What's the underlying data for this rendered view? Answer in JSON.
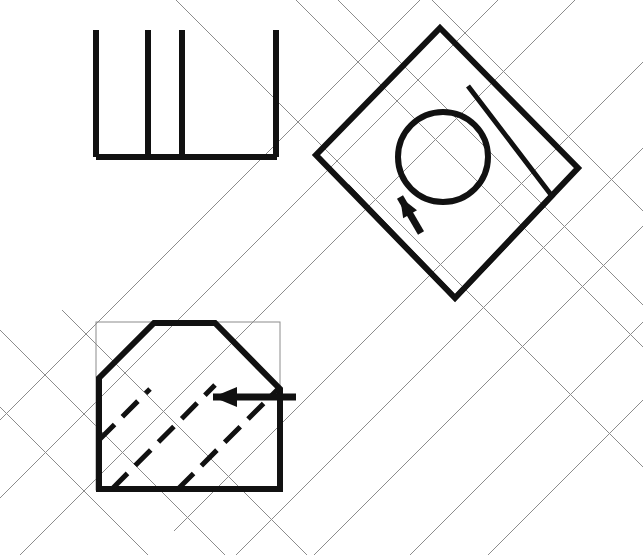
{
  "drawing": {
    "title": "Orthographic and auxiliary view projection",
    "canvas": {
      "width": 643,
      "height": 555,
      "background": "#ffffff"
    },
    "styles": {
      "object_color": "#111111",
      "construction_color": "#8c8c8c",
      "hidden_color": "#111111",
      "object_width": 6,
      "construction_width": 1,
      "hidden_dash": "22 11"
    },
    "views": [
      {
        "id": "top-view",
        "name": "Top view (plan)",
        "description": "Open rectangle outline with three internal vertical division lines",
        "bounds": {
          "x": 93,
          "y": 30,
          "width": 186,
          "height": 130
        },
        "elements": {
          "bottom_edge": {
            "x1": 96,
            "y1": 157,
            "x2": 277,
            "y2": 157
          },
          "vertical_lines": [
            {
              "x": 96,
              "y1": 30,
              "y2": 157
            },
            {
              "x": 148,
              "y1": 30,
              "y2": 157
            },
            {
              "x": 182,
              "y1": 30,
              "y2": 157
            },
            {
              "x": 276,
              "y1": 30,
              "y2": 157
            }
          ]
        }
      },
      {
        "id": "auxiliary-view",
        "name": "Auxiliary view (rotated 45 degrees)",
        "description": "Diamond outline with inner offset square, circular hole and viewing arrow",
        "outer_diamond": [
          {
            "x": 440,
            "y": 28
          },
          {
            "x": 578,
            "y": 168
          },
          {
            "x": 455,
            "y": 298
          },
          {
            "x": 316,
            "y": 155
          }
        ],
        "inner_square": [
          {
            "x": 468,
            "y": 86
          },
          {
            "x": 552,
            "y": 196
          },
          {
            "x": 455,
            "y": 298
          },
          {
            "x": 347,
            "y": 186
          }
        ],
        "circle": {
          "cx": 443,
          "cy": 157,
          "r": 45
        },
        "arrow": {
          "x1": 421,
          "y1": 233,
          "x2": 400,
          "y2": 197,
          "direction": "up-left"
        }
      },
      {
        "id": "front-view",
        "name": "Front view with chamfer",
        "description": "Hexagonal outline with chamfered upper-left and lower-right corners, hidden edges shown dashed, enclosed by grey construction rectangle",
        "construction_box": {
          "x": 96,
          "y": 322,
          "width": 184,
          "height": 168
        },
        "outline": [
          {
            "x": 99,
            "y": 378
          },
          {
            "x": 154,
            "y": 323
          },
          {
            "x": 215,
            "y": 323
          },
          {
            "x": 280,
            "y": 389
          },
          {
            "x": 280,
            "y": 489
          },
          {
            "x": 99,
            "y": 489
          }
        ],
        "hidden_lines": [
          {
            "x1": 112,
            "y1": 489,
            "x2": 215,
            "y2": 385
          },
          {
            "x1": 178,
            "y1": 489,
            "x2": 280,
            "y2": 387
          },
          {
            "x1": 99,
            "y1": 440,
            "x2": 150,
            "y2": 389
          }
        ],
        "arrow": {
          "x1": 296,
          "y1": 397,
          "x2": 213,
          "y2": 397,
          "direction": "left"
        }
      }
    ],
    "construction_lines": {
      "description": "Light grey 45-degree projection lines linking the three views",
      "down_right_45": [
        {
          "x1": 176,
          "y1": 0,
          "x2": 643,
          "y2": 467
        },
        {
          "x1": 296,
          "y1": 0,
          "x2": 643,
          "y2": 347
        },
        {
          "x1": 338,
          "y1": 0,
          "x2": 643,
          "y2": 305
        },
        {
          "x1": 432,
          "y1": 0,
          "x2": 643,
          "y2": 211
        },
        {
          "x1": 0,
          "y1": 330,
          "x2": 225,
          "y2": 555
        },
        {
          "x1": 0,
          "y1": 407,
          "x2": 148,
          "y2": 555
        },
        {
          "x1": 62,
          "y1": 310,
          "x2": 307,
          "y2": 555
        }
      ],
      "down_left_45": [
        {
          "x1": 643,
          "y1": 62,
          "x2": 174,
          "y2": 531
        },
        {
          "x1": 643,
          "y1": 148,
          "x2": 236,
          "y2": 555
        },
        {
          "x1": 643,
          "y1": 226,
          "x2": 314,
          "y2": 555
        },
        {
          "x1": 643,
          "y1": 322,
          "x2": 410,
          "y2": 555
        },
        {
          "x1": 643,
          "y1": 400,
          "x2": 488,
          "y2": 555
        },
        {
          "x1": 575,
          "y1": 0,
          "x2": 20,
          "y2": 555
        },
        {
          "x1": 498,
          "y1": 0,
          "x2": 0,
          "y2": 498
        },
        {
          "x1": 420,
          "y1": 0,
          "x2": 0,
          "y2": 420
        }
      ]
    }
  }
}
